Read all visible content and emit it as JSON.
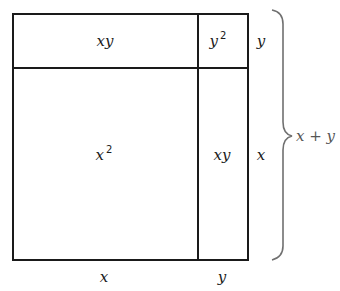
{
  "diagram": {
    "regions": {
      "top_left": {
        "base": "xy",
        "exp": ""
      },
      "top_right": {
        "base": "y",
        "exp": "2"
      },
      "bottom_left": {
        "base": "x",
        "exp": "2"
      },
      "bottom_right": {
        "base": "xy",
        "exp": ""
      }
    },
    "side_labels": {
      "right_top": "y",
      "right_bottom": "x",
      "bottom_left": "x",
      "bottom_right": "y"
    },
    "brace_label": "x + y",
    "colors": {
      "stroke": "#1a1a1a",
      "brace": "#707070"
    }
  }
}
